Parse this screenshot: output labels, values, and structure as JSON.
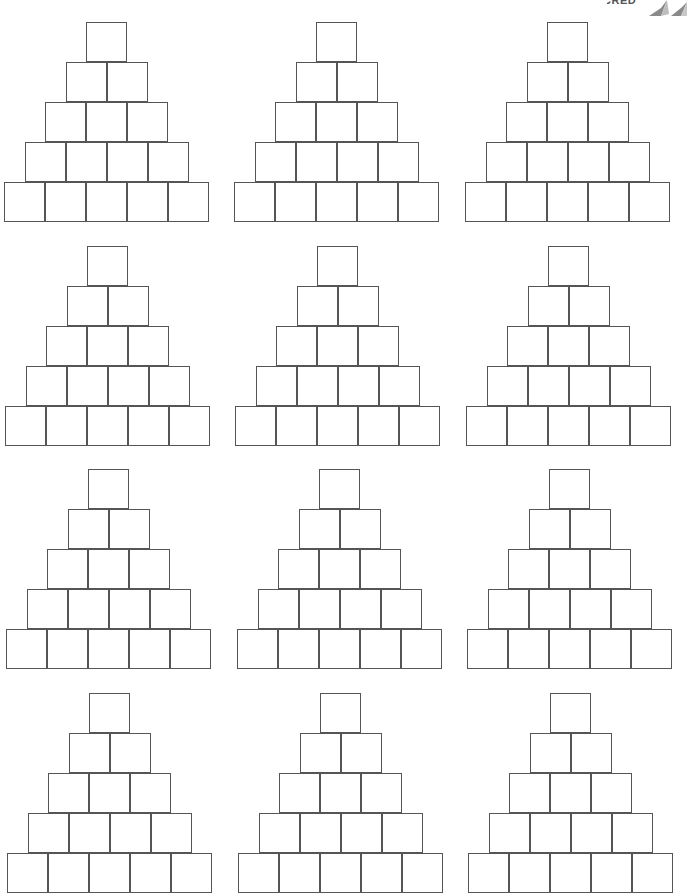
{
  "page": {
    "logo_text": "CRED",
    "line_color": "#555555",
    "background": "#ffffff"
  },
  "layout": {
    "box_width": 41,
    "box_height": 40,
    "levels": [
      1,
      2,
      3,
      4,
      5
    ]
  },
  "pyramids": [
    {
      "id": 1,
      "x": 4,
      "y": 22
    },
    {
      "id": 2,
      "x": 234,
      "y": 22
    },
    {
      "id": 3,
      "x": 465,
      "y": 22
    },
    {
      "id": 4,
      "x": 5,
      "y": 246
    },
    {
      "id": 5,
      "x": 235,
      "y": 246
    },
    {
      "id": 6,
      "x": 466,
      "y": 246
    },
    {
      "id": 7,
      "x": 6,
      "y": 469
    },
    {
      "id": 8,
      "x": 237,
      "y": 469
    },
    {
      "id": 9,
      "x": 467,
      "y": 469
    },
    {
      "id": 10,
      "x": 7,
      "y": 693
    },
    {
      "id": 11,
      "x": 238,
      "y": 693
    },
    {
      "id": 12,
      "x": 468,
      "y": 693
    }
  ]
}
